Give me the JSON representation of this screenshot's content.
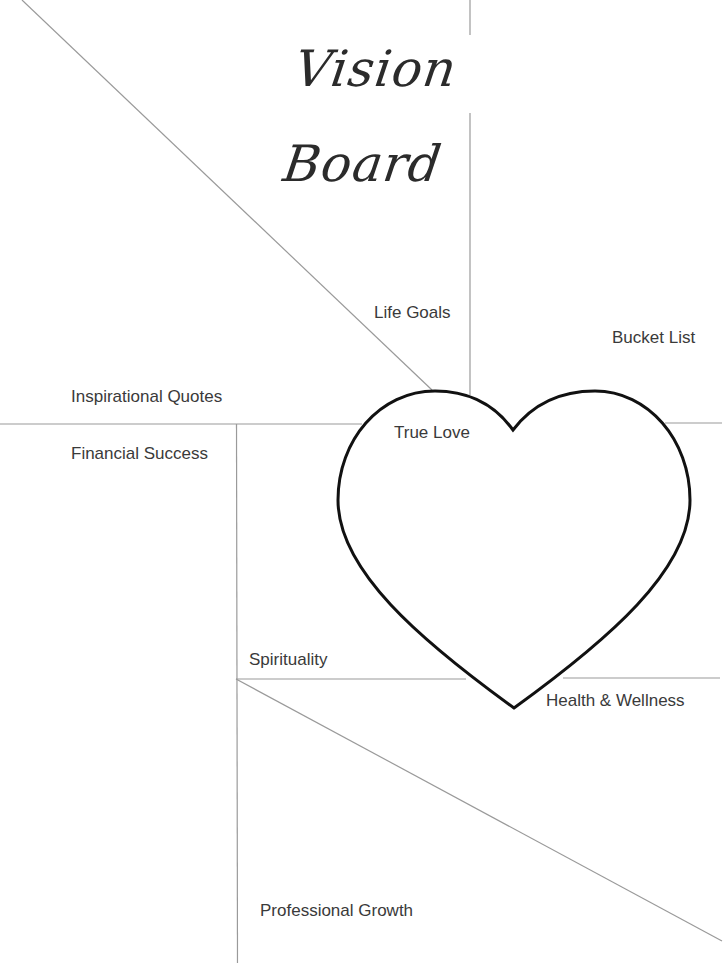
{
  "title": "Vision Board",
  "sections": {
    "life_goals": "Life Goals",
    "bucket_list": "Bucket List",
    "inspirational_quotes": "Inspirational Quotes",
    "true_love": "True Love",
    "financial_success": "Financial Success",
    "spirituality": "Spirituality",
    "health_wellness": "Health & Wellness",
    "professional_growth": "Professional Growth"
  },
  "colors": {
    "line": "#9a9a9a",
    "heart_stroke": "#111111",
    "text": "#3a3a3a"
  }
}
